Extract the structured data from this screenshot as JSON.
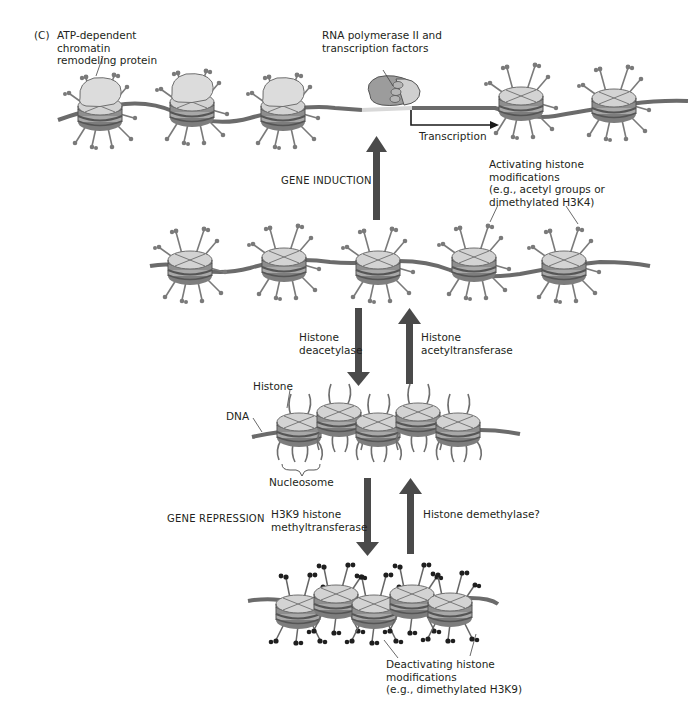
{
  "panel": {
    "label": "(C)"
  },
  "labels": {
    "remodeler": "ATP-dependent\nchromatin\nremodeling protein",
    "polymerase": "RNA polymerase II and\ntranscription factors",
    "transcription": "Transcription",
    "gene_induction": "GENE INDUCTION",
    "activating": "Activating histone\nmodifications\n(e.g., acetyl groups or\ndimethylated H3K4)",
    "deacetylase": "Histone\ndeacetylase",
    "acetyltransferase": "Histone\nacetyltransferase",
    "histone": "Histone",
    "dna": "DNA",
    "nucleosome": "Nucleosome",
    "gene_repression": "GENE REPRESSION",
    "methyltransferase": "H3K9 histone\nmethyltransferase",
    "demethylase": "Histone demethylase?",
    "deactivating": "Deactivating histone\nmodifications\n(e.g., dimethylated H3K9)"
  },
  "colors": {
    "dna": "#6b6b6b",
    "histone_top": "#d4d4d4",
    "histone_band": "#8a8a8a",
    "arrow": "#4a4a4a",
    "remodeler": "#dcdcdc",
    "polymerase": "#9a9a9a",
    "tail_active": "#7a7a7a",
    "tail_repressive": "#2a2a2a"
  },
  "states": [
    {
      "name": "transcribing",
      "nucleosomes": 5,
      "y": 108
    },
    {
      "name": "activated",
      "nucleosomes": 5,
      "y": 265
    },
    {
      "name": "unmodified",
      "nucleosomes": 5,
      "y": 430
    },
    {
      "name": "repressed",
      "nucleosomes": 5,
      "y": 610
    }
  ]
}
